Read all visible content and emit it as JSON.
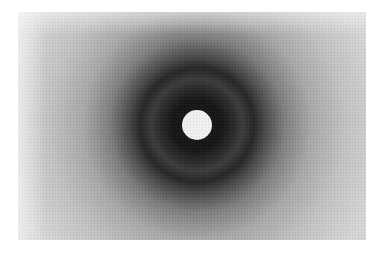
{
  "figure": {
    "center": {
      "x": 179,
      "y": 113
    },
    "beam_stop_radius": 15,
    "colors": {
      "background": "#ffffff",
      "film_outer": "#cfcfcf",
      "film_mid": "#9a9a9a",
      "ring_dark": "#1e1e1e",
      "band_light": "#3a3a3a",
      "beam_stop": "#f2f2f2"
    }
  }
}
